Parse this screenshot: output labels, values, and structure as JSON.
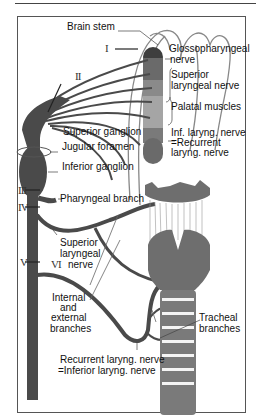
{
  "figure": {
    "colors": {
      "nerve": "#4a4a4a",
      "cartilage": "#6e6e6e",
      "muscle_light": "#a0a0a0",
      "muscle_mid": "#8a8a8a",
      "muscle_dark": "#3e3e3e",
      "outline": "#777777",
      "frame": "#555555"
    },
    "labels": {
      "brain_stem": "Brain stem",
      "glossopharyngeal_1": "Glossopharyngeal",
      "glossopharyngeal_2": "nerve",
      "superior_laryngeal_top_1": "Superior",
      "superior_laryngeal_top_2": "laryngeal nerve",
      "palatal_muscles": "Palatal muscles",
      "inf_laryng_1": "Inf. laryng. nerve",
      "inf_laryng_2": "=Recurrent",
      "inf_laryng_3": "laryng. nerve",
      "superior_ganglion": "Superior ganglion",
      "jugular_foramen": "Jugular foramen",
      "inferior_ganglion": "Inferior ganglion",
      "pharyngeal_branch": "Pharyngeal branch",
      "superior_laryngeal_1": "Superior",
      "superior_laryngeal_2": "laryngeal",
      "superior_laryngeal_3": "nerve",
      "internal_1": "Internal",
      "internal_2": "and",
      "internal_3": "external",
      "internal_4": "branches",
      "tracheal_1": "Tracheal",
      "tracheal_2": "branches",
      "recurrent_1": "Recurrent laryng. nerve",
      "recurrent_2": "=Inferior laryng. nerve"
    },
    "roman_numerals": {
      "I": "I",
      "II": "II",
      "III": "III",
      "IV": "IV",
      "V": "V",
      "VI": "VI"
    }
  }
}
